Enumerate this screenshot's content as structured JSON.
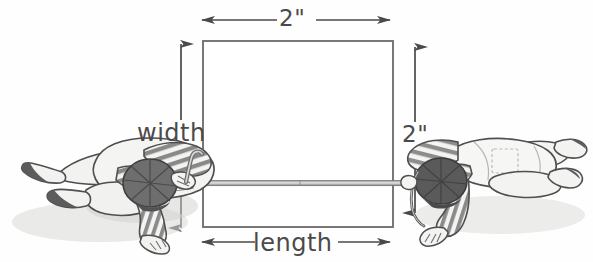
{
  "figure": {
    "background_color": "#fefefe",
    "stroke_color": "#4a4a4a",
    "shape": {
      "name": "square",
      "x": 203,
      "y": 41,
      "width": 190,
      "height": 186
    },
    "labels": {
      "top_dimension": "2\"",
      "right_dimension": "2\"",
      "width_label": "width",
      "length_label": "length"
    },
    "dimension_lines": [
      {
        "name": "top-dimension-arrow",
        "orientation": "horizontal",
        "from": 200,
        "to": 392,
        "at": 20,
        "value": "2\""
      },
      {
        "name": "bottom-length-arrow",
        "orientation": "horizontal",
        "from": 200,
        "to": 392,
        "at": 242,
        "value": "length"
      },
      {
        "name": "left-width-arrow",
        "orientation": "vertical",
        "from": 42,
        "to": 230,
        "at": 181,
        "value": "width"
      },
      {
        "name": "right-dimension-arrow",
        "orientation": "vertical",
        "from": 45,
        "to": 215,
        "at": 415,
        "value": "2\""
      }
    ],
    "rope": {
      "name": "measuring-rope",
      "from_x": 186,
      "to_x": 412,
      "y": 183
    },
    "characters": [
      {
        "name": "left-character",
        "description": "cartoon figure lying on side pulling rope to the left",
        "facing": "right",
        "cap_color": "#6e6e6e",
        "shirt": "striped",
        "pants": "#f2f2f0"
      },
      {
        "name": "right-character",
        "description": "cartoon figure lying on side pulling rope to the right",
        "facing": "left",
        "cap_color": "#5a5a5a",
        "shirt": "striped",
        "pants": "#f4f4f2"
      }
    ]
  }
}
